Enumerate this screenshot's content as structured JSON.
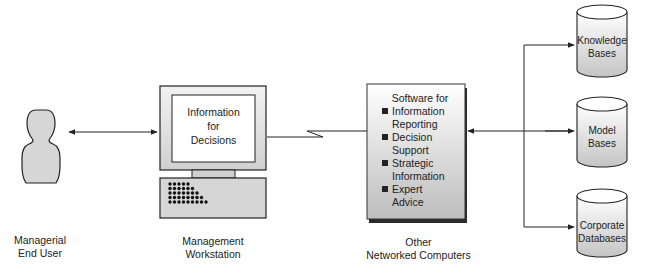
{
  "nodes": {
    "user": {
      "label_line1": "Managerial",
      "label_line2": "End User",
      "icon": "person-silhouette-icon"
    },
    "workstation": {
      "screen_line1": "Information",
      "screen_line2": "for",
      "screen_line3": "Decisions",
      "label_line1": "Management",
      "label_line2": "Workstation",
      "icon": "computer-icon"
    },
    "server": {
      "heading": "Software for",
      "items": [
        {
          "line1": "Information",
          "line2": "Reporting"
        },
        {
          "line1": "Decision",
          "line2": "Support"
        },
        {
          "line1": "Strategic",
          "line2": "Information"
        },
        {
          "line1": "Expert",
          "line2": "Advice"
        }
      ],
      "label_line1": "Other",
      "label_line2": "Networked Computers"
    },
    "databases": [
      {
        "line1": "Knowledge",
        "line2": "Bases"
      },
      {
        "line1": "Model",
        "line2": "Bases"
      },
      {
        "line1": "Corporate",
        "line2": "Databases"
      }
    ]
  },
  "colors": {
    "fill_gray": "#d4d4d4",
    "stroke": "#222222",
    "keyboard_dots": "#111111"
  }
}
